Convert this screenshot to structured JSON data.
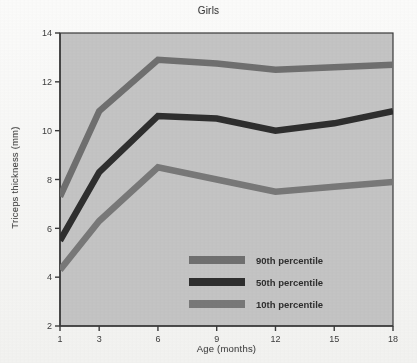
{
  "chart_data": {
    "type": "line",
    "title": "Girls",
    "xlabel": "Age (months)",
    "ylabel": "Triceps thickness (mm)",
    "x": [
      1,
      3,
      6,
      9,
      12,
      15,
      18
    ],
    "xticklabels": [
      "1",
      "3",
      "6",
      "9",
      "12",
      "15",
      "18"
    ],
    "yticklabels": [
      "2",
      "4",
      "6",
      "8",
      "10",
      "12",
      "14"
    ],
    "yticks": [
      2,
      4,
      6,
      8,
      10,
      12,
      14
    ],
    "xlim": [
      1,
      18
    ],
    "ylim": [
      2,
      14
    ],
    "grid": false,
    "legend_position": "center-bottom-inside",
    "series": [
      {
        "name": "90th percentile",
        "color": "#6f6f6f",
        "values": [
          7.3,
          10.8,
          12.9,
          12.75,
          12.5,
          12.6,
          12.7
        ]
      },
      {
        "name": "50th percentile",
        "color": "#2e2e2e",
        "values": [
          5.5,
          8.3,
          10.6,
          10.5,
          10.0,
          10.3,
          10.8
        ]
      },
      {
        "name": "10th percentile",
        "color": "#787878",
        "values": [
          4.3,
          6.3,
          8.5,
          8.0,
          7.5,
          7.7,
          7.9
        ]
      }
    ]
  },
  "figure": {
    "plot_background": "#c4c4c4",
    "axis_color": "#3a3a3a",
    "page_background": "#f4f4f2"
  },
  "legend": {
    "items": [
      {
        "label": "90th percentile",
        "color": "#6f6f6f"
      },
      {
        "label": "50th percentile",
        "color": "#2e2e2e"
      },
      {
        "label": "10th percentile",
        "color": "#787878"
      }
    ]
  }
}
